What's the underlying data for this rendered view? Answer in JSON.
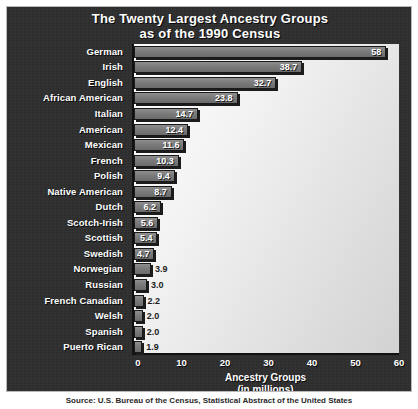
{
  "chart_data": {
    "type": "bar",
    "orientation": "horizontal",
    "title": "The Twenty Largest Ancestry Groups as of the 1990 Census",
    "title_lines": [
      "The Twenty Largest Ancestry Groups",
      "as of the 1990 Census"
    ],
    "xlabel": "Ancestry Groups (in millions)",
    "xlabel_lines": [
      "Ancestry Groups",
      "(in millions)"
    ],
    "ylabel": "",
    "xlim": [
      0,
      60
    ],
    "xticks": [
      0,
      10,
      20,
      30,
      40,
      50,
      60
    ],
    "xtick_labels": [
      "0",
      "10",
      "20",
      "30",
      "40",
      "50",
      "60"
    ],
    "grid": false,
    "legend": false,
    "units": "millions",
    "categories": [
      "German",
      "Irish",
      "English",
      "African American",
      "Italian",
      "American",
      "Mexican",
      "French",
      "Polish",
      "Native American",
      "Dutch",
      "Scotch-Irish",
      "Scottish",
      "Swedish",
      "Norwegian",
      "Russian",
      "French Canadian",
      "Welsh",
      "Spanish",
      "Puerto Rican"
    ],
    "values": [
      58,
      38.7,
      32.7,
      23.8,
      14.7,
      12.4,
      11.6,
      10.3,
      9.4,
      8.7,
      6.2,
      5.6,
      5.4,
      4.7,
      3.9,
      3.0,
      2.2,
      2.0,
      2.0,
      1.9
    ],
    "value_labels": [
      "58",
      "38.7",
      "32.7",
      "23.8",
      "14.7",
      "12.4",
      "11.6",
      "10.3",
      "9.4",
      "8.7",
      "6.2",
      "5.6",
      "5.4",
      "4.7",
      "3.9",
      "3.0",
      "2.2",
      "2.0",
      "2.0",
      "1.9"
    ],
    "label_placement": [
      "inside",
      "inside",
      "inside",
      "inside",
      "inside",
      "inside",
      "inside",
      "inside",
      "inside",
      "inside",
      "inside",
      "inside",
      "inside",
      "inside",
      "outside",
      "outside",
      "outside",
      "outside",
      "outside",
      "outside"
    ]
  },
  "caption": {
    "source": "Source: U.S. Bureau of the Census, Statistical Abstract of the United States"
  },
  "colors": {
    "panel_background": "#2e2e2e",
    "panel_border": "#b8b8b8",
    "plot_background": "#f2f2f2",
    "bar_fill": "#7b7b7b",
    "bar_outline": "#1a1a1a",
    "bar_shadow": "#1c1c1c",
    "title_text": "#ffffff",
    "label_text": "#ffffff",
    "value_text_inside": "#ffffff",
    "value_text_outside": "#1c1c1c",
    "axis_line": "#111111"
  }
}
